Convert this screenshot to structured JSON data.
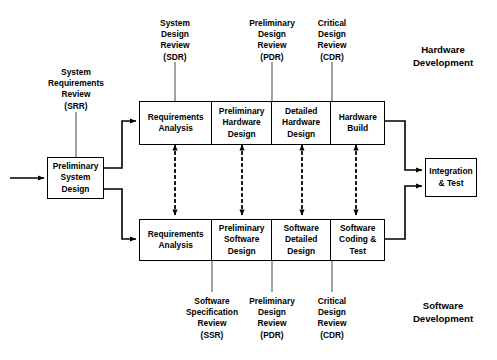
{
  "diagram": {
    "colors": {
      "stroke": "#000000",
      "background": "#ffffff",
      "connector": "#444444"
    },
    "entry_node": {
      "label": "Preliminary\nSystem\nDesign",
      "lines": [
        "Preliminary",
        "System",
        "Design"
      ]
    },
    "exit_node": {
      "label": "Integration\n& Test",
      "lines": [
        "Integration",
        "& Test"
      ]
    },
    "hardware_row": {
      "section_label": "Hardware\nDevelopment",
      "section_label_lines": [
        "Hardware",
        "Development"
      ],
      "cells": [
        {
          "lines": [
            "Requirements",
            "Analysis"
          ]
        },
        {
          "lines": [
            "Preliminary",
            "Hardware",
            "Design"
          ]
        },
        {
          "lines": [
            "Detailed",
            "Hardware",
            "Design"
          ]
        },
        {
          "lines": [
            "Hardware",
            "Build"
          ]
        }
      ]
    },
    "software_row": {
      "section_label": "Software\nDevelopment",
      "section_label_lines": [
        "Software",
        "Development"
      ],
      "cells": [
        {
          "lines": [
            "Requirements",
            "Analysis"
          ]
        },
        {
          "lines": [
            "Preliminary",
            "Software",
            "Design"
          ]
        },
        {
          "lines": [
            "Software",
            "Detailed",
            "Design"
          ]
        },
        {
          "lines": [
            "Software",
            "Coding &",
            "Test"
          ]
        }
      ]
    },
    "reviews_top": [
      {
        "id": "srr",
        "lines": [
          "System",
          "Requirements",
          "Review",
          "(SRR)"
        ],
        "abbr": "SRR"
      },
      {
        "id": "sdr",
        "lines": [
          "System",
          "Design",
          "Review",
          "(SDR)"
        ],
        "abbr": "SDR"
      },
      {
        "id": "pdr-hw",
        "lines": [
          "Preliminary",
          "Design",
          "Review",
          "(PDR)"
        ],
        "abbr": "PDR"
      },
      {
        "id": "cdr-hw",
        "lines": [
          "Critical",
          "Design",
          "Review",
          "(CDR)"
        ],
        "abbr": "CDR"
      }
    ],
    "reviews_bottom": [
      {
        "id": "ssr",
        "lines": [
          "Software",
          "Specification",
          "Review",
          "(SSR)"
        ],
        "abbr": "SSR"
      },
      {
        "id": "pdr-sw",
        "lines": [
          "Preliminary",
          "Design",
          "Review",
          "(PDR)"
        ],
        "abbr": "PDR"
      },
      {
        "id": "cdr-sw",
        "lines": [
          "Critical",
          "Design",
          "Review",
          "(CDR)"
        ],
        "abbr": "CDR"
      }
    ]
  }
}
